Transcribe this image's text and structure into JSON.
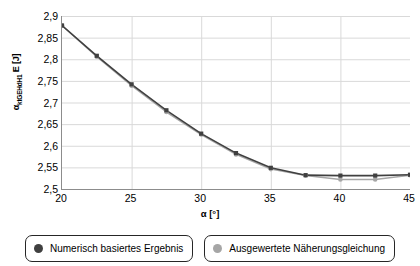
{
  "chart_data": {
    "type": "line",
    "title": "",
    "xlabel": "α [°]",
    "ylabel": "α_ktGEHdH1 E [J]",
    "ylabel_main": "E [J]",
    "ylabel_sub": "ktGEHdH1",
    "ylabel_symbol": "α",
    "xlim": [
      20,
      45
    ],
    "ylim": [
      2.5,
      2.9
    ],
    "grid": true,
    "legend_position": "bottom",
    "x_ticks": [
      "20",
      "25",
      "30",
      "35",
      "40",
      "45"
    ],
    "x_tick_values": [
      20,
      25,
      30,
      35,
      40,
      45
    ],
    "y_ticks": [
      "2,5",
      "2,55",
      "2,6",
      "2,65",
      "2,7",
      "2,75",
      "2,8",
      "2,85",
      "2,9"
    ],
    "y_tick_values": [
      2.5,
      2.55,
      2.6,
      2.65,
      2.7,
      2.75,
      2.8,
      2.85,
      2.9
    ],
    "x": [
      20,
      22.5,
      25,
      27.5,
      30,
      32.5,
      35,
      37.5,
      40,
      42.5,
      45
    ],
    "series": [
      {
        "name": "Numerisch basiertes Ergebnis",
        "color": "#404040",
        "values": [
          2.878,
          2.808,
          2.742,
          2.682,
          2.628,
          2.583,
          2.549,
          2.532,
          2.531,
          2.531,
          2.533
        ]
      },
      {
        "name": "Ausgewertete Näherungsgleichung",
        "color": "#a6a6a6",
        "values": [
          2.878,
          2.806,
          2.739,
          2.678,
          2.626,
          2.58,
          2.546,
          2.531,
          2.522,
          2.522,
          2.532
        ]
      }
    ]
  },
  "legend": {
    "items": [
      {
        "label": "Numerisch basiertes Ergebnis",
        "color": "#404040"
      },
      {
        "label": "Ausgewertete Näherungsgleichung",
        "color": "#a6a6a6"
      }
    ]
  },
  "colors": {
    "series_dark": "#404040",
    "series_light": "#a6a6a6",
    "grid": "#d9d9d9",
    "axis": "#8c8c8c",
    "legend_border": "#262626"
  }
}
